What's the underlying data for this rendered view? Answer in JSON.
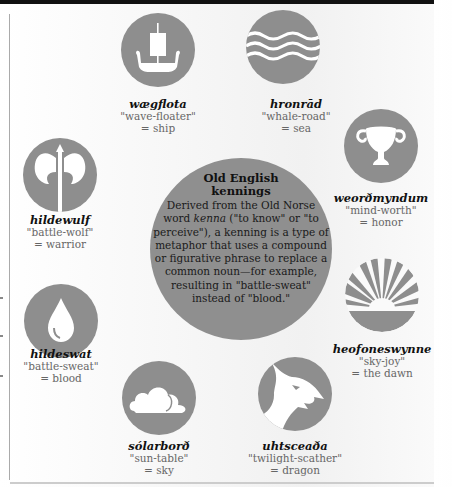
{
  "center": {
    "title": "Old English kennings",
    "body_parts": [
      "Derived from the Old Norse word ",
      "kenna",
      " (\"to know\" or \"to perceive\"), a kenning is a type of metaphor that uses a compound or figurative phrase to replace a common noun—for example, resulting in \"battle-sweat\" instead of \"blood.\""
    ]
  },
  "kennings": [
    {
      "term": "wægflota",
      "literal": "\"wave-floater\"",
      "meaning": "= ship",
      "icon": "ship-icon"
    },
    {
      "term": "hronrād",
      "literal": "\"whale-road\"",
      "meaning": "= sea",
      "icon": "waves-icon"
    },
    {
      "term": "weorðmyndum",
      "literal": "\"mind-worth\"",
      "meaning": "= honor",
      "icon": "trophy-icon"
    },
    {
      "term": "heofoneswynne",
      "literal": "\"sky-joy\"",
      "meaning": "= the dawn",
      "icon": "sunrise-icon"
    },
    {
      "term": "uhtsceaða",
      "literal": "\"twilight-scather\"",
      "meaning": "= dragon",
      "icon": "dragon-icon"
    },
    {
      "term": "sólarborð",
      "literal": "\"sun-table\"",
      "meaning": "= sky",
      "icon": "cloud-icon"
    },
    {
      "term": "hildeswat",
      "literal": "\"battle-sweat\"",
      "meaning": "= blood",
      "icon": "drop-icon"
    },
    {
      "term": "hildewulf",
      "literal": "\"battle-wolf\"",
      "meaning": "= warrior",
      "icon": "axe-icon"
    }
  ],
  "colors": {
    "circle": "#8e8e8e",
    "icon": "#ffffff",
    "term_text": "#111111",
    "gloss_text": "#666666"
  }
}
